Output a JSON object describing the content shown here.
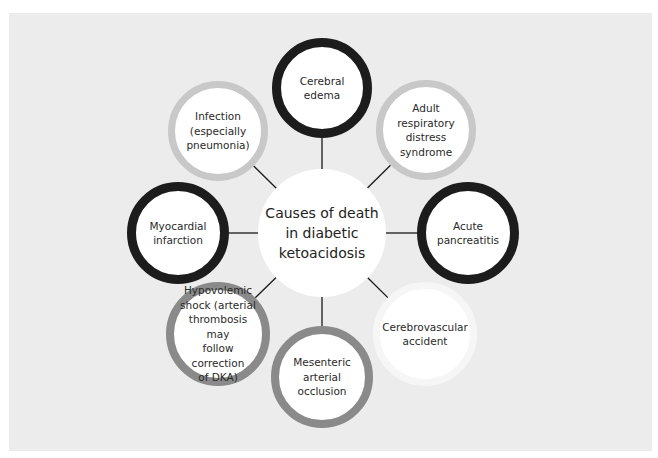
{
  "diagram": {
    "type": "hub-and-spoke",
    "background_color": "#ececec",
    "center": {
      "label": "Causes of death\nin diabetic\nketoacidosis",
      "x": 322,
      "y": 233,
      "r": 64
    },
    "nodes": [
      {
        "id": "cerebral-edema",
        "label": "Cerebral\nedema",
        "x": 322,
        "y": 88,
        "r": 50,
        "ring_color": "#1c1c1c",
        "ring_width": 9
      },
      {
        "id": "adult-respiratory-distress-syndrome",
        "label": "Adult\nrespiratory\ndistress\nsyndrome",
        "x": 426,
        "y": 130,
        "r": 50,
        "ring_color": "#c8c8c8",
        "ring_width": 7
      },
      {
        "id": "acute-pancreatitis",
        "label": "Acute\npancreatitis",
        "x": 468,
        "y": 233,
        "r": 51,
        "ring_color": "#1c1c1c",
        "ring_width": 9
      },
      {
        "id": "cerebrovascular-accident",
        "label": "Cerebrovascular\naccident",
        "x": 425,
        "y": 334,
        "r": 52,
        "ring_color": "#f6f6f6",
        "ring_width": 7
      },
      {
        "id": "mesenteric-arterial-occlusion",
        "label": "Mesenteric\narterial\nocclusion",
        "x": 322,
        "y": 377,
        "r": 51,
        "ring_color": "#8a8a8a",
        "ring_width": 8
      },
      {
        "id": "hypovolemic-shock",
        "label": "Hypovolemic\nshock (arterial\nthrombosis may\nfollow correction\nof DKA)",
        "x": 218,
        "y": 334,
        "r": 52,
        "ring_color": "#8a8a8a",
        "ring_width": 8
      },
      {
        "id": "myocardial-infarction",
        "label": "Myocardial\ninfarction",
        "x": 178,
        "y": 233,
        "r": 51,
        "ring_color": "#1c1c1c",
        "ring_width": 9
      },
      {
        "id": "infection",
        "label": "Infection\n(especially\npneumonia)",
        "x": 218,
        "y": 131,
        "r": 50,
        "ring_color": "#c8c8c8",
        "ring_width": 7
      }
    ],
    "connector_color": "#1a1a1a"
  }
}
